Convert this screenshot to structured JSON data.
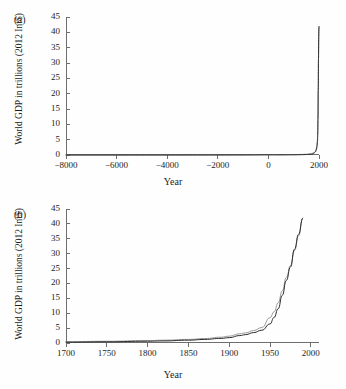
{
  "figure": {
    "background": "#fefefe",
    "axis_color": "#6e6e6e",
    "series_colors": {
      "grey": "#8f8f8f",
      "black": "#2b2b2b"
    }
  },
  "panels": {
    "a": {
      "tag": "(a)",
      "ylabel": "World GDP in trillions (2012 Int$)",
      "xlabel": "Year",
      "xticks": [
        "-8000",
        "-6000",
        "-4000",
        "-2000",
        "0",
        "2000"
      ],
      "yticks": [
        "0",
        "5",
        "10",
        "15",
        "20",
        "25",
        "30",
        "35",
        "40",
        "45"
      ]
    },
    "b": {
      "tag": "(b)",
      "ylabel": "World GDP in trillions (2012 Int$)",
      "xlabel": "Year",
      "xticks": [
        "1700",
        "1750",
        "1800",
        "1850",
        "1900",
        "1950",
        "2000"
      ],
      "yticks": [
        "0",
        "5",
        "10",
        "15",
        "20",
        "25",
        "30",
        "35",
        "40",
        "45"
      ]
    }
  },
  "chart_data": [
    {
      "type": "line",
      "panel": "(a)",
      "title": "",
      "xlabel": "Year",
      "ylabel": "World GDP in trillions (2012 Int$)",
      "xlim": [
        -8000,
        2000
      ],
      "ylim": [
        0,
        45
      ],
      "xticks": [
        -8000,
        -6000,
        -4000,
        -2000,
        0,
        2000
      ],
      "yticks": [
        0,
        5,
        10,
        15,
        20,
        25,
        30,
        35,
        40,
        45
      ],
      "grid": false,
      "legend": "none",
      "series": [
        {
          "name": "grey",
          "color": "#8f8f8f",
          "x": [
            -8000,
            -6000,
            -4000,
            -2000,
            -1000,
            0,
            500,
            1000,
            1300,
            1500,
            1600,
            1700,
            1750,
            1800,
            1850,
            1900,
            1920,
            1940,
            1950,
            1960,
            1970,
            1980,
            1990
          ],
          "y": [
            0.0,
            0.0,
            0.01,
            0.03,
            0.05,
            0.1,
            0.1,
            0.12,
            0.18,
            0.25,
            0.33,
            0.43,
            0.58,
            0.8,
            1.2,
            2.2,
            3.4,
            5.2,
            8.5,
            13.5,
            22.0,
            31.0,
            42.0
          ]
        },
        {
          "name": "black",
          "color": "#2b2b2b",
          "x": [
            -8000,
            -6000,
            -4000,
            -2000,
            -1000,
            0,
            500,
            1000,
            1300,
            1500,
            1600,
            1700,
            1750,
            1800,
            1850,
            1900,
            1920,
            1940,
            1950,
            1960,
            1970,
            1980,
            1990
          ],
          "y": [
            0.0,
            0.0,
            0.0,
            0.01,
            0.02,
            0.05,
            0.05,
            0.07,
            0.1,
            0.15,
            0.2,
            0.28,
            0.4,
            0.6,
            0.95,
            1.8,
            2.8,
            4.3,
            6.4,
            11.5,
            21.0,
            31.5,
            42.0
          ]
        }
      ]
    },
    {
      "type": "line",
      "panel": "(b)",
      "title": "",
      "xlabel": "Year",
      "ylabel": "World GDP in trillions (2012 Int$)",
      "xlim": [
        1700,
        2010
      ],
      "ylim": [
        0,
        45
      ],
      "xticks": [
        1700,
        1750,
        1800,
        1850,
        1900,
        1950,
        2000
      ],
      "yticks": [
        0,
        5,
        10,
        15,
        20,
        25,
        30,
        35,
        40,
        45
      ],
      "grid": false,
      "legend": "none",
      "series": [
        {
          "name": "grey",
          "color": "#8f8f8f",
          "x": [
            1700,
            1750,
            1800,
            1820,
            1850,
            1870,
            1890,
            1900,
            1913,
            1920,
            1930,
            1940,
            1950,
            1955,
            1960,
            1965,
            1970,
            1975,
            1980,
            1985,
            1990
          ],
          "y": [
            0.43,
            0.58,
            0.8,
            0.95,
            1.2,
            1.5,
            1.95,
            2.3,
            3.1,
            3.4,
            4.2,
            5.2,
            8.5,
            10.5,
            13.5,
            17.5,
            22.0,
            26.0,
            31.0,
            36.0,
            42.0
          ]
        },
        {
          "name": "black",
          "color": "#2b2b2b",
          "x": [
            1700,
            1750,
            1800,
            1820,
            1850,
            1870,
            1890,
            1900,
            1913,
            1920,
            1930,
            1940,
            1950,
            1955,
            1960,
            1965,
            1970,
            1975,
            1980,
            1985,
            1990
          ],
          "y": [
            0.28,
            0.4,
            0.6,
            0.7,
            0.95,
            1.2,
            1.55,
            1.8,
            2.5,
            2.8,
            3.5,
            4.3,
            6.4,
            8.6,
            11.5,
            16.0,
            21.0,
            25.5,
            31.5,
            36.5,
            42.0
          ]
        }
      ]
    }
  ]
}
